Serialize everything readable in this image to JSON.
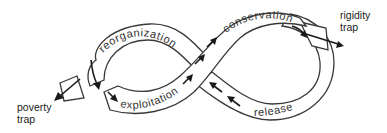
{
  "diagram": {
    "type": "adaptive-cycle",
    "phases": [
      {
        "id": "reorganization",
        "label": "reorganization"
      },
      {
        "id": "exploitation",
        "label": "exploitation"
      },
      {
        "id": "conservation",
        "label": "conservation"
      },
      {
        "id": "release",
        "label": "release"
      }
    ],
    "traps": [
      {
        "id": "poverty",
        "line1": "poverty",
        "line2": "trap"
      },
      {
        "id": "rigidity",
        "line1": "rigidity",
        "line2": "trap"
      }
    ],
    "colors": {
      "stroke": "#3a3a3a",
      "arrow": "#1a1a1a",
      "text": "#333333",
      "background": "#ffffff"
    }
  }
}
